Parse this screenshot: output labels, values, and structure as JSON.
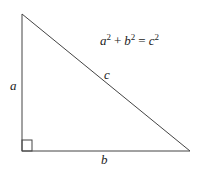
{
  "diagram": {
    "type": "right-triangle",
    "equation": {
      "terms": [
        {
          "base": "a",
          "exp": "2"
        },
        {
          "op": "+"
        },
        {
          "base": "b",
          "exp": "2"
        },
        {
          "op": "="
        },
        {
          "base": "c",
          "exp": "2"
        }
      ],
      "text": "a² + b² = c²"
    },
    "labels": {
      "vertical_leg": "a",
      "horizontal_leg": "b",
      "hypotenuse": "c"
    },
    "colors": {
      "stroke": "#444444",
      "text": "#222222",
      "background": "#ffffff"
    }
  }
}
